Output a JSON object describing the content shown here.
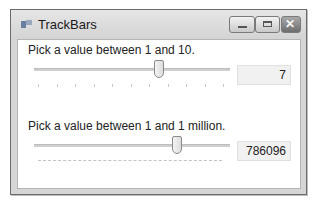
{
  "window": {
    "title": "TrackBars",
    "controls": {
      "minimize": "minimize",
      "maximize": "maximize",
      "close": "close"
    }
  },
  "trackbar1": {
    "label": "Pick a value between 1 and 10.",
    "min": 1,
    "max": 10,
    "value": "7",
    "tick_count": 10
  },
  "trackbar2": {
    "label": "Pick a value between 1 and 1 million.",
    "min": 1,
    "max": 1000000,
    "value": "786096"
  }
}
